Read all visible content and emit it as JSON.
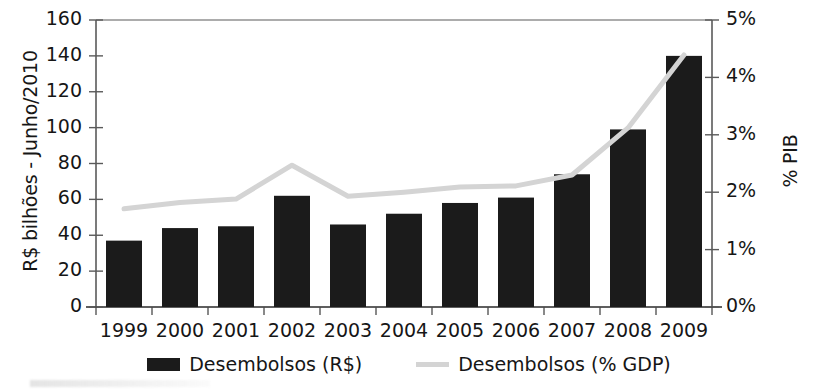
{
  "chart_data": {
    "type": "bar",
    "title": "",
    "subtitle": "",
    "categories": [
      "1999",
      "2000",
      "2001",
      "2002",
      "2003",
      "2004",
      "2005",
      "2006",
      "2007",
      "2008",
      "2009"
    ],
    "xlabel": "",
    "series": [
      {
        "name": "Desembolsos (R$)",
        "type": "bar",
        "axis": "left",
        "color": "#1b1b1b",
        "values": [
          37,
          44,
          45,
          62,
          46,
          52,
          58,
          61,
          74,
          99,
          140
        ]
      },
      {
        "name": "Desembolsos (% GDP)",
        "type": "line",
        "axis": "right",
        "color": "#d4d4d4",
        "values": [
          1.71,
          1.82,
          1.88,
          2.47,
          1.93,
          2.0,
          2.09,
          2.11,
          2.3,
          3.12,
          4.39
        ]
      }
    ],
    "left_axis": {
      "label": "R$ bilhões - Junho/2010",
      "ticks": [
        0,
        20,
        40,
        60,
        80,
        100,
        120,
        140,
        160
      ],
      "tick_labels": [
        "0",
        "20",
        "40",
        "60",
        "80",
        "100",
        "120",
        "140",
        "160"
      ],
      "ylim": [
        0,
        160
      ]
    },
    "right_axis": {
      "label": "% PIB",
      "ticks": [
        0,
        1,
        2,
        3,
        4,
        5
      ],
      "tick_labels": [
        "0%",
        "1%",
        "2%",
        "3%",
        "4%",
        "5%"
      ],
      "ylim": [
        0,
        5
      ]
    },
    "grid": false,
    "legend_position": "bottom",
    "legend": [
      {
        "label": "Desembolsos (R$)",
        "marker": "bar-swatch",
        "color": "#1b1b1b"
      },
      {
        "label": "Desembolsos (% GDP)",
        "marker": "line-swatch",
        "color": "#d4d4d4"
      }
    ]
  }
}
